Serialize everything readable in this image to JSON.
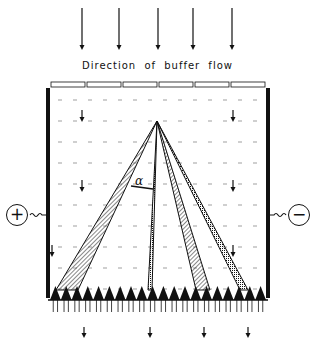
{
  "diagram": {
    "caption": "Direction of buffer flow",
    "angle_label": "α",
    "anode": {
      "symbol": "+",
      "side": "left"
    },
    "cathode": {
      "symbol": "−",
      "side": "right"
    },
    "colors": {
      "ink": "#111111",
      "background": "#ffffff"
    },
    "top_arrows_x": [
      82,
      119,
      158,
      193,
      232
    ],
    "inner_arrows": [
      {
        "x": 82,
        "y": 110
      },
      {
        "x": 82,
        "y": 180
      },
      {
        "x": 233,
        "y": 110
      },
      {
        "x": 233,
        "y": 180
      },
      {
        "x": 233,
        "y": 245
      },
      {
        "x": 52,
        "y": 245
      }
    ],
    "bottom_arrows_x": [
      84,
      150,
      204,
      248
    ],
    "apex": {
      "x": 157,
      "y": 121
    },
    "bands": [
      {
        "id": "band-left",
        "base_x": [
          56,
          78
        ],
        "pattern": "hatch"
      },
      {
        "id": "band-center",
        "base_x": [
          148,
          152
        ],
        "pattern": "dots"
      },
      {
        "id": "band-right-inner",
        "base_x": [
          196,
          210
        ],
        "pattern": "hatch"
      },
      {
        "id": "band-right-outer",
        "base_x": [
          240,
          248
        ],
        "pattern": "dots"
      }
    ],
    "teeth_count": 20,
    "inlet_segments": 6
  }
}
